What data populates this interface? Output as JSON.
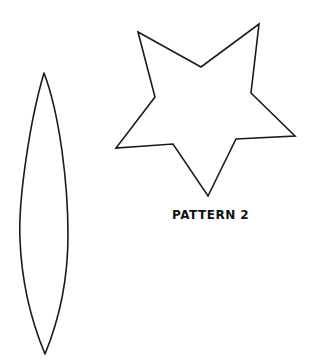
{
  "labels": {
    "pattern_2": "PATTERN 2"
  },
  "colors": {
    "stroke": "#1a1a1a",
    "background": "#ffffff"
  },
  "shapes": {
    "leaf": {
      "name": "leaf-shape",
      "top": [
        44,
        73
      ],
      "bottom": [
        45,
        354
      ],
      "left_x": 20,
      "right_x": 68
    },
    "star": {
      "name": "star-shape",
      "points": [
        [
          138,
          32
        ],
        [
          201,
          67
        ],
        [
          259,
          24
        ],
        [
          251,
          93
        ],
        [
          295,
          136
        ],
        [
          236,
          139
        ],
        [
          208,
          196
        ],
        [
          173,
          144
        ],
        [
          116,
          148
        ],
        [
          155,
          97
        ]
      ]
    }
  }
}
